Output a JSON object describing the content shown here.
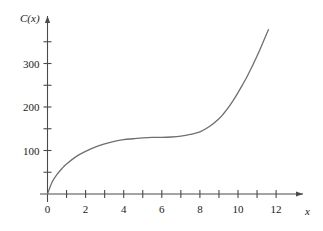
{
  "chart_data": {
    "type": "line",
    "title": "",
    "subtitle": "",
    "xlabel": "x",
    "ylabel": "C(x)",
    "xlim": [
      0,
      12.6
    ],
    "ylim": [
      0,
      390
    ],
    "grid": false,
    "legend": null,
    "x_ticks_major": [
      0,
      2,
      4,
      6,
      8,
      10,
      12
    ],
    "x_ticks_minor": [
      1,
      3,
      5,
      7,
      9,
      11
    ],
    "x_tick_labels": [
      "0",
      "2",
      "4",
      "6",
      "8",
      "10",
      "12"
    ],
    "y_ticks_major": [
      100,
      200,
      300
    ],
    "y_ticks_minor": [
      50,
      150,
      250,
      350
    ],
    "y_tick_labels": [
      "100",
      "200",
      "300"
    ],
    "series": [
      {
        "name": "C(x)",
        "color": "#6f6f70",
        "x": [
          0.0,
          0.25,
          0.5,
          0.75,
          1.0,
          1.5,
          2.0,
          2.5,
          3.0,
          3.5,
          4.0,
          4.5,
          5.0,
          5.5,
          6.0,
          6.5,
          7.0,
          7.5,
          8.0,
          8.5,
          9.0,
          9.25,
          9.5,
          9.75,
          10.0,
          10.25,
          10.5,
          10.75,
          11.0,
          11.25,
          11.5,
          11.6
        ],
        "y": [
          0,
          28,
          45,
          58,
          69,
          86,
          98,
          108,
          115,
          121,
          125,
          127,
          129,
          130,
          130,
          131,
          133,
          137,
          143,
          155,
          173,
          185,
          199,
          215,
          233,
          252,
          272,
          294,
          317,
          342,
          368,
          378
        ]
      }
    ],
    "axis_color": "#4a4a4a",
    "curve_color": "#6f6f70",
    "background_color": "#ffffff"
  },
  "axes": {
    "y_axis_label": "C(x)",
    "x_axis_label": "x",
    "origin_label": "0"
  },
  "labels": {
    "y": [
      "300",
      "200",
      "100"
    ],
    "x": [
      "0",
      "2",
      "4",
      "6",
      "8",
      "10",
      "12"
    ]
  }
}
